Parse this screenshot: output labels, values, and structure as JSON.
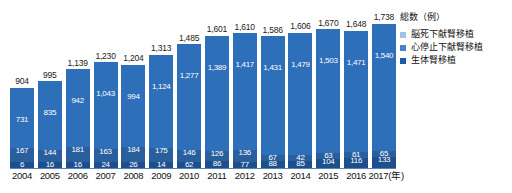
{
  "chart_data": {
    "type": "bar",
    "title": "",
    "xlabel": "年",
    "ylabel": "",
    "stacked": true,
    "grid": false,
    "legend_position": "right",
    "legend_title": "総数（例）",
    "categories": [
      "2004",
      "2005",
      "2006",
      "2007",
      "2008",
      "2009",
      "2010",
      "2011",
      "2012",
      "2013",
      "2014",
      "2015",
      "2016",
      "2017"
    ],
    "totals": [
      "904",
      "995",
      "1,139",
      "1,230",
      "1,204",
      "1,313",
      "1,485",
      "1,601",
      "1,610",
      "1,586",
      "1,606",
      "1,670",
      "1,648",
      "1,738"
    ],
    "totals_numeric": [
      904,
      995,
      1139,
      1230,
      1204,
      1313,
      1485,
      1601,
      1610,
      1586,
      1606,
      1670,
      1648,
      1738
    ],
    "ylim": [
      0,
      1800
    ],
    "series": [
      {
        "name": "生体腎移植",
        "color": "#2d6fb8",
        "values": [
          731,
          835,
          942,
          1043,
          994,
          1124,
          1277,
          1389,
          1417,
          1431,
          1479,
          1503,
          1471,
          1540
        ],
        "labels": [
          "731",
          "835",
          "942",
          "1,043",
          "994",
          "1,124",
          "1,277",
          "1,389",
          "1,417",
          "1,431",
          "1,479",
          "1,503",
          "1,471",
          "1,540"
        ]
      },
      {
        "name": "心停止下献腎移植",
        "color": "#2a5f9e",
        "values": [
          167,
          144,
          181,
          163,
          184,
          175,
          146,
          126,
          136,
          67,
          42,
          63,
          61,
          65
        ],
        "labels": [
          "167",
          "144",
          "181",
          "163",
          "184",
          "175",
          "146",
          "126",
          "136",
          "67",
          "42",
          "63",
          "61",
          "65"
        ]
      },
      {
        "name": "脳死下献腎移植",
        "color": "#1d4f8c",
        "values": [
          6,
          16,
          16,
          24,
          26,
          14,
          62,
          86,
          77,
          88,
          85,
          104,
          116,
          133
        ],
        "labels": [
          "6",
          "16",
          "16",
          "24",
          "26",
          "14",
          "62",
          "86",
          "77",
          "88",
          "85",
          "104",
          "116",
          "133"
        ]
      }
    ]
  },
  "legend": {
    "title": "総数（例）",
    "items": [
      {
        "label": "脳死下献腎移植",
        "color": "#9fc3e8"
      },
      {
        "label": "心停止下献腎移植",
        "color": "#4a83c4"
      },
      {
        "label": "生体腎移植",
        "color": "#1d5aa8"
      }
    ]
  },
  "axis": {
    "x_unit_suffix": "(年)",
    "ticks": [
      "2004",
      "2005",
      "2006",
      "2007",
      "2008",
      "2009",
      "2010",
      "2011",
      "2012",
      "2013",
      "2014",
      "2015",
      "2016",
      "2017"
    ],
    "last_tick_display": "2017(年)"
  }
}
